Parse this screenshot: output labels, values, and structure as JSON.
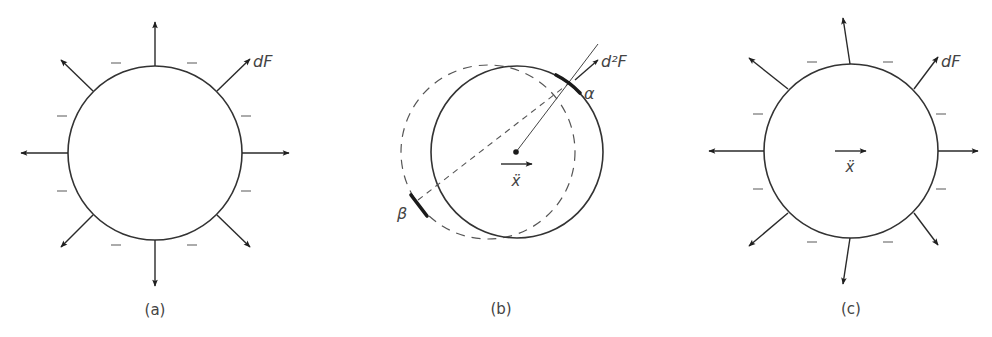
{
  "figure": {
    "panels": [
      {
        "id": "a",
        "caption": "(a)",
        "force_label": "dF",
        "arrow_count": 8,
        "charge_sign": "−",
        "charge_mark_count": 8,
        "description": "Uniformly charged sphere with symmetric outward surface forces"
      },
      {
        "id": "b",
        "caption": "(b)",
        "force_label": "d²F",
        "acceleration_label": "ẍ",
        "point_alpha": "α",
        "point_beta": "β",
        "description": "Sphere displaced relative to its earlier (dashed) position; interaction between surface elements α and β"
      },
      {
        "id": "c",
        "caption": "(c)",
        "force_label": "dF",
        "acceleration_label": "ẍ",
        "arrow_count": 8,
        "charge_sign": "−",
        "charge_mark_count": 8,
        "description": "Accelerating charged sphere with asymmetric surface forces"
      }
    ],
    "colors": {
      "stroke": "#333333",
      "text": "#444444",
      "background": "#ffffff"
    }
  }
}
